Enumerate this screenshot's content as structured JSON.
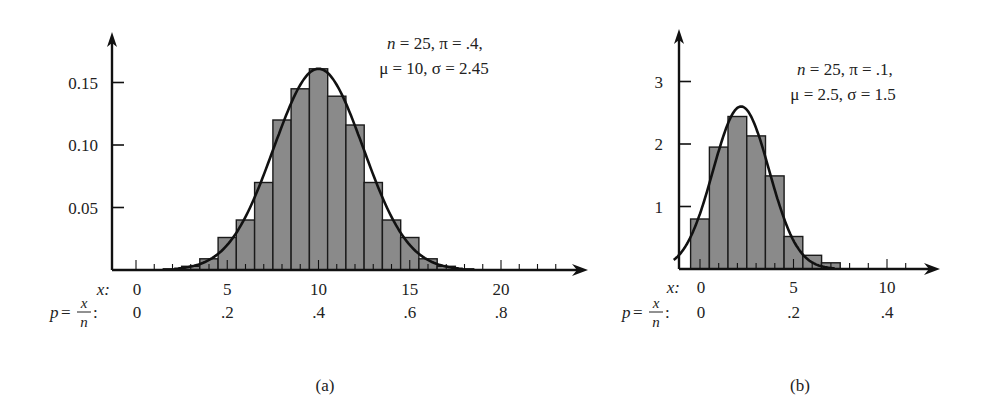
{
  "figure": {
    "panels": [
      {
        "id": "a",
        "caption": "(a)",
        "annotation_line1": "n = 25, π = .4,",
        "annotation_line2": "μ = 10, σ = 2.45",
        "x_row_label": "x:",
        "p_row_label": "p = x/n:",
        "x_tick_labels": [
          "0",
          "5",
          "10",
          "15",
          "20"
        ],
        "p_tick_labels": [
          "0",
          ".2",
          ".4",
          ".6",
          ".8"
        ],
        "y_tick_labels": [
          "0.05",
          "0.10",
          "0.15"
        ]
      },
      {
        "id": "b",
        "caption": "(b)",
        "annotation_line1": "n = 25, π = .1,",
        "annotation_line2": "μ = 2.5, σ = 1.5",
        "x_row_label": "x:",
        "p_row_label": "p = x/n:",
        "x_tick_labels": [
          "0",
          "5",
          "10"
        ],
        "p_tick_labels": [
          "0",
          ".2",
          ".4"
        ],
        "y_tick_labels": [
          "1",
          "2",
          "3"
        ]
      }
    ],
    "colors": {
      "bar_fill": "#8a8a8a",
      "bar_stroke": "#1a1a1a",
      "axis": "#111111",
      "curve": "#111111"
    }
  },
  "chart_data": [
    {
      "type": "bar",
      "title": "(a) Binomial n = 25, π = .4 with normal approximation",
      "annotation": [
        "n = 25, π = .4,",
        "μ = 10, σ = 2.45"
      ],
      "xlabel": "x:",
      "xlabel2": "p = x/n:",
      "ylabel": "",
      "x": [
        2,
        3,
        4,
        5,
        6,
        7,
        8,
        9,
        10,
        11,
        12,
        13,
        14,
        15,
        16,
        17,
        18
      ],
      "values": [
        0.001,
        0.003,
        0.009,
        0.026,
        0.04,
        0.07,
        0.12,
        0.145,
        0.161,
        0.139,
        0.116,
        0.07,
        0.04,
        0.026,
        0.009,
        0.003,
        0.001
      ],
      "x_ticks": [
        0,
        5,
        10,
        15,
        20
      ],
      "x_tick_labels": [
        "0",
        "5",
        "10",
        "15",
        "20"
      ],
      "p_tick_labels": [
        "0",
        ".2",
        ".4",
        ".6",
        ".8"
      ],
      "y_ticks": [
        0.05,
        0.1,
        0.15
      ],
      "y_tick_labels": [
        "0.05",
        "0.10",
        "0.15"
      ],
      "xlim": [
        -1.3,
        24.5
      ],
      "ylim": [
        0,
        0.19
      ],
      "overlay_curve": {
        "type": "normal",
        "mu": 10,
        "sigma": 2.45,
        "peak": 0.161,
        "x_range": [
          2.1,
          17.9
        ]
      },
      "grid": false,
      "legend": null
    },
    {
      "type": "bar",
      "title": "(b) Binomial n = 25, π = .1 with normal approximation",
      "annotation": [
        "n = 25, π = .1,",
        "μ = 2.5, σ = 1.5"
      ],
      "xlabel": "x:",
      "xlabel2": "p = x/n:",
      "ylabel": "",
      "x": [
        0,
        1,
        2,
        3,
        4,
        5,
        6,
        7
      ],
      "values": [
        0.8,
        1.95,
        2.44,
        2.13,
        1.49,
        0.52,
        0.22,
        0.1
      ],
      "x_ticks": [
        0,
        5,
        10
      ],
      "x_tick_labels": [
        "0",
        "5",
        "10"
      ],
      "p_tick_labels": [
        "0",
        ".2",
        ".4"
      ],
      "y_ticks": [
        1,
        2,
        3
      ],
      "y_tick_labels": [
        "1",
        "2",
        "3"
      ],
      "xlim": [
        -1.4,
        12.8
      ],
      "ylim": [
        0,
        3.8
      ],
      "overlay_curve": {
        "type": "normal",
        "mu": 2.2,
        "sigma": 1.5,
        "peak": 2.6,
        "x_range": [
          -1.4,
          7.2
        ]
      },
      "grid": false,
      "legend": null
    }
  ]
}
